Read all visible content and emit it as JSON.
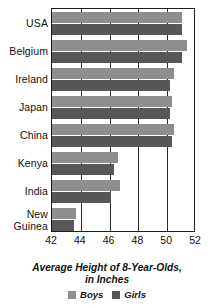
{
  "chart_data": {
    "type": "bar",
    "orientation": "horizontal",
    "title": "",
    "xlabel": "Average Height of 8-Year-Olds, in Inches",
    "ylabel": "",
    "xlim": [
      42,
      52
    ],
    "xticks": [
      42,
      44,
      46,
      48,
      50,
      52
    ],
    "grid": true,
    "legend_position": "bottom",
    "categories": [
      "USA",
      "Belgium",
      "Ireland",
      "Japan",
      "China",
      "Kenya",
      "India",
      "New Guinea"
    ],
    "series": [
      {
        "name": "Boys",
        "color": "#8e8e8e",
        "values": [
          51.0,
          51.4,
          50.5,
          50.3,
          50.5,
          46.6,
          46.7,
          43.7
        ]
      },
      {
        "name": "Girls",
        "color": "#575757",
        "values": [
          51.0,
          51.0,
          50.2,
          50.2,
          50.3,
          46.3,
          46.1,
          43.5
        ]
      }
    ]
  },
  "axis_title_lines": [
    "Average Height of 8-Year-Olds,",
    "in Inches"
  ],
  "legend": {
    "items": [
      {
        "label": "Boys",
        "swatch": "legend-swatch-boys"
      },
      {
        "label": "Girls",
        "swatch": "legend-swatch-girls"
      }
    ]
  },
  "colors": {
    "boys": "#8e8e8e",
    "girls": "#575757",
    "axis": "#1a1a1a",
    "background": "#ffffff"
  }
}
